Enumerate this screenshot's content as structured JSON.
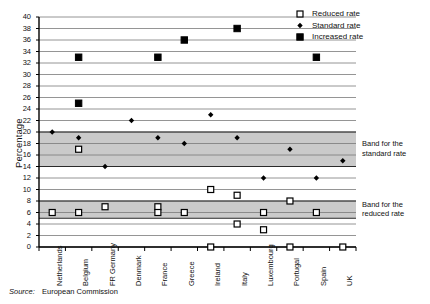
{
  "chart_data": {
    "type": "scatter",
    "title": "",
    "xlabel": "",
    "ylabel": "Percentage",
    "ylim": [
      0,
      40
    ],
    "ytick_step": 2,
    "grid": true,
    "categories": [
      "Netherlands",
      "Belgium",
      "FR Germany",
      "Denmark",
      "France",
      "Greece",
      "Ireland",
      "Italy",
      "Luxembourg",
      "Portugal",
      "Spain",
      "UK"
    ],
    "yticks": [
      0,
      2,
      4,
      6,
      8,
      10,
      12,
      14,
      16,
      18,
      20,
      22,
      24,
      26,
      28,
      30,
      32,
      34,
      36,
      38,
      40
    ],
    "series": [
      {
        "name": "Reduced rate",
        "marker": "open-square",
        "values_by_category": {
          "Netherlands": [
            6
          ],
          "Belgium": [
            17,
            6
          ],
          "FR Germany": [
            7
          ],
          "Denmark": [],
          "France": [
            7,
            6
          ],
          "Greece": [
            6
          ],
          "Ireland": [
            10,
            0
          ],
          "Italy": [
            9,
            4
          ],
          "Luxembourg": [
            6,
            3
          ],
          "Portugal": [
            8,
            0
          ],
          "Spain": [
            6
          ],
          "UK": [
            0
          ]
        }
      },
      {
        "name": "Standard rate",
        "marker": "small-filled-diamond",
        "values_by_category": {
          "Netherlands": [
            20
          ],
          "Belgium": [
            19
          ],
          "FR Germany": [
            14
          ],
          "Denmark": [
            22
          ],
          "France": [
            19
          ],
          "Greece": [
            18
          ],
          "Ireland": [
            23
          ],
          "Italy": [
            19
          ],
          "Luxembourg": [
            12
          ],
          "Portugal": [
            17
          ],
          "Spain": [
            12
          ],
          "UK": [
            15
          ]
        }
      },
      {
        "name": "Increased rate",
        "marker": "filled-square",
        "values_by_category": {
          "Netherlands": [],
          "Belgium": [
            33,
            25
          ],
          "FR Germany": [],
          "Denmark": [],
          "France": [
            33
          ],
          "Greece": [
            36
          ],
          "Ireland": [],
          "Italy": [
            38
          ],
          "Luxembourg": [],
          "Portugal": [],
          "Spain": [
            33
          ],
          "UK": []
        }
      }
    ],
    "bands": [
      {
        "id": "standard",
        "label_line1": "Band for the",
        "label_line2": "standard rate",
        "from": 14,
        "to": 20
      },
      {
        "id": "reduced",
        "label_line1": "Band for the",
        "label_line2": "reduced rate",
        "from": 5,
        "to": 8
      }
    ],
    "legend": {
      "position": "top-right",
      "entries": [
        {
          "label": "Reduced rate",
          "marker": "open-square"
        },
        {
          "label": "Standard rate",
          "marker": "small-filled-diamond"
        },
        {
          "label": "Increased rate",
          "marker": "filled-square"
        }
      ]
    },
    "colors": {
      "marker": "#000000",
      "grid": "#7a7a7a",
      "axis": "#000000",
      "band_fill": "#b5b5b5",
      "background": "#ffffff"
    }
  },
  "source": {
    "label": "Source:",
    "value": "European Commission"
  }
}
